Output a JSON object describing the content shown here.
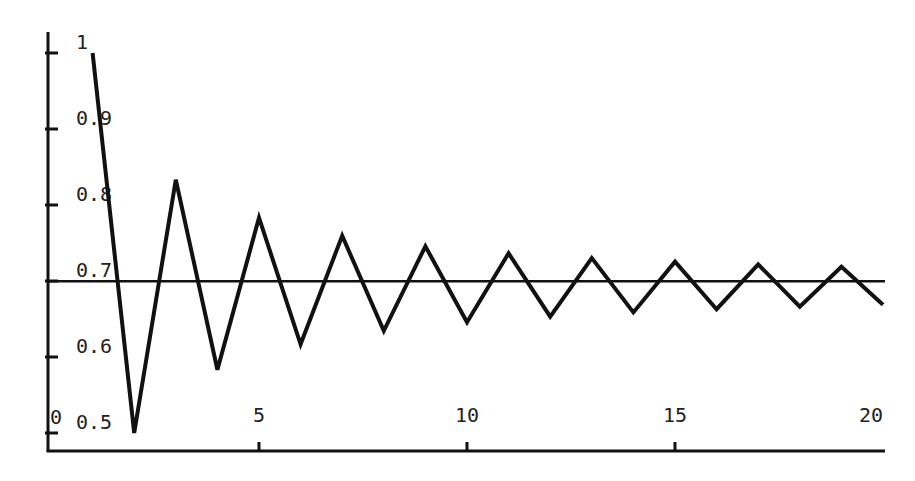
{
  "chart_data": {
    "type": "line",
    "title": "",
    "xlabel": "",
    "ylabel": "",
    "xlim": [
      0,
      20
    ],
    "ylim": [
      0.5,
      1
    ],
    "grid": false,
    "x_ticks": [
      5,
      10,
      15,
      20
    ],
    "x_tick_labels": [
      "5",
      "10",
      "15",
      "20"
    ],
    "y_ticks": [
      0.5,
      0.6,
      0.7,
      0.8,
      0.9,
      1
    ],
    "y_tick_labels": [
      "0.5",
      "0.6",
      "0.7",
      "0.8",
      "0.9",
      "1"
    ],
    "origin_label": "0",
    "x": [
      1,
      2,
      3,
      4,
      5,
      6,
      7,
      8,
      9,
      10,
      11,
      12,
      13,
      14,
      15,
      16,
      17,
      18,
      19,
      20
    ],
    "series": [
      {
        "name": "partial sums",
        "values": [
          1.0,
          0.5,
          0.8333,
          0.5833,
          0.7833,
          0.6167,
          0.7595,
          0.6345,
          0.7456,
          0.6456,
          0.7365,
          0.6532,
          0.7301,
          0.6587,
          0.7254,
          0.6629,
          0.7218,
          0.6662,
          0.7188,
          0.6688
        ]
      }
    ],
    "reference_line": {
      "y": 0.6931,
      "orientation": "horizontal"
    }
  },
  "colors": {
    "ink": "#111111",
    "background": "#ffffff"
  }
}
